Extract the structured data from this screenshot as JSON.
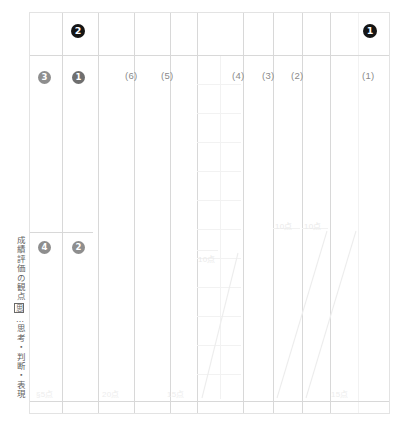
{
  "document": {
    "title": "成績評価の観点 答案用紙",
    "vertical_caption": {
      "head": "成績評価の観点",
      "boxed_symbol": "思",
      "tail": "…思考・判断・表現"
    }
  },
  "badges": [
    {
      "id": "badge-2-top",
      "label": "❶",
      "text": "2",
      "style": "black"
    },
    {
      "id": "badge-1-top",
      "label": "❶",
      "text": "1",
      "style": "black"
    },
    {
      "id": "badge-3-row",
      "label": "❸",
      "text": "3",
      "style": "gray"
    },
    {
      "id": "badge-1-row",
      "label": "❶",
      "text": "1",
      "style": "dgray"
    },
    {
      "id": "badge-4-mid",
      "label": "❹",
      "text": "4",
      "style": "gray"
    },
    {
      "id": "badge-2-mid",
      "label": "❷",
      "text": "2",
      "style": "gray"
    }
  ],
  "column_headers": [
    {
      "label": "(6)"
    },
    {
      "label": "(5)"
    },
    {
      "label": "(4)"
    },
    {
      "label": "(3)"
    },
    {
      "label": "(2)"
    },
    {
      "label": "(1)"
    }
  ],
  "point_labels": {
    "bottom": [
      {
        "label": "§5点"
      },
      {
        "label": "20点"
      },
      {
        "label": "15点"
      },
      {
        "label": "15点"
      }
    ],
    "inline": [
      {
        "label": "10点"
      },
      {
        "label": "10点"
      },
      {
        "label": "10点"
      }
    ]
  },
  "colors": {
    "frame_border": "#e3e3e3",
    "grid_line": "#e9e9e9",
    "grid_line_faint": "#f2f2f2",
    "badge_black": "#151515",
    "badge_gray": "#8e8e8e",
    "header_text": "#8a8a8a",
    "caption_text": "#5f5f5f",
    "point_text": "#ededed"
  }
}
